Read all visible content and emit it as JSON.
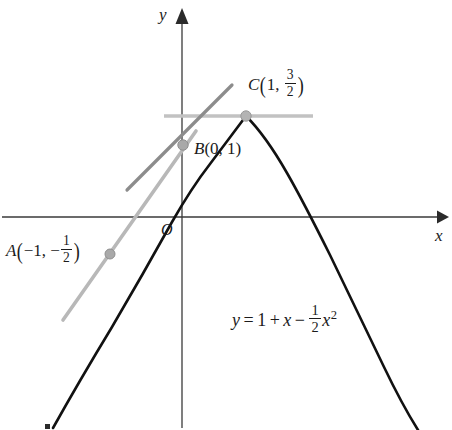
{
  "figure": {
    "axes": {
      "x_label": "x",
      "y_label": "y",
      "origin_label": "O",
      "origin_px": {
        "x": 182,
        "y": 217
      },
      "unit_px": 72,
      "x_axis_y_px": 217,
      "y_axis_x_px": 182
    },
    "colors": {
      "curve": "#111111",
      "axis": "#3a3a3a",
      "tangent": "#8c8c8c",
      "chord": "#b5b5b5",
      "horizontal": "#c2c2c2",
      "point_fill": "#a9a9a9",
      "point_stroke": "#8f8f8f",
      "text": "#1b1b1b"
    },
    "equation": {
      "lhs": "y",
      "equals": "=",
      "term_constant": "1",
      "op_plus": "+",
      "term_x": "x",
      "op_minus": "−",
      "coeff_num": "1",
      "coeff_den": "2",
      "term_xsq_base": "x",
      "term_xsq_exp": "2",
      "full_text": "y = 1 + x − 1/2 x²"
    },
    "points": [
      {
        "id": "A",
        "name": "A",
        "x_text": "−1",
        "y_num": "1",
        "y_den": "2",
        "y_sign": "−",
        "label_text": "A(−1, −1/2)",
        "x_value": -1,
        "y_value": -0.5,
        "px": {
          "x": 110,
          "y": 254
        },
        "label_px": {
          "x": 6,
          "y": 236
        }
      },
      {
        "id": "B",
        "name": "B",
        "x_text": "0",
        "y_text": "1",
        "label_text": "B(0, 1)",
        "x_value": 0,
        "y_value": 1,
        "px": {
          "x": 183,
          "y": 145
        },
        "label_px": {
          "x": 194,
          "y": 142
        }
      },
      {
        "id": "C",
        "name": "C",
        "x_text": "1",
        "y_num": "3",
        "y_den": "2",
        "label_text": "C(1, 3/2)",
        "x_value": 1,
        "y_value": 1.5,
        "px": {
          "x": 246,
          "y": 116
        },
        "label_px": {
          "x": 248,
          "y": 68
        }
      }
    ],
    "curve": {
      "type": "parabola",
      "equation": "y = 1 + x - 0.5*x^2",
      "vertex": {
        "x": 1,
        "y": 1.5
      },
      "x_intercepts": [
        -0.4142,
        2.4142
      ],
      "y_intercept": 1,
      "x_domain": [
        -1.78,
        3.45
      ]
    },
    "tangent_line": {
      "description": "tangent to curve at B(0, 1), slope 1",
      "slope": 1,
      "through": {
        "x": 0,
        "y": 1
      },
      "px_start": {
        "x": 127,
        "y": 190
      },
      "px_end": {
        "x": 232,
        "y": 85
      }
    },
    "chord_line": {
      "description": "chord through A(-1, -1/2) and C(1, 3/2), slope 1",
      "slope": 1,
      "px_start": {
        "x": 63,
        "y": 320
      },
      "px_end": {
        "x": 196,
        "y": 131
      }
    },
    "horizontal_line": {
      "description": "horizontal line through vertex C at y = 3/2",
      "y_value": 1.5,
      "px_y": 116,
      "px_x_start": 164,
      "px_x_end": 313
    }
  }
}
